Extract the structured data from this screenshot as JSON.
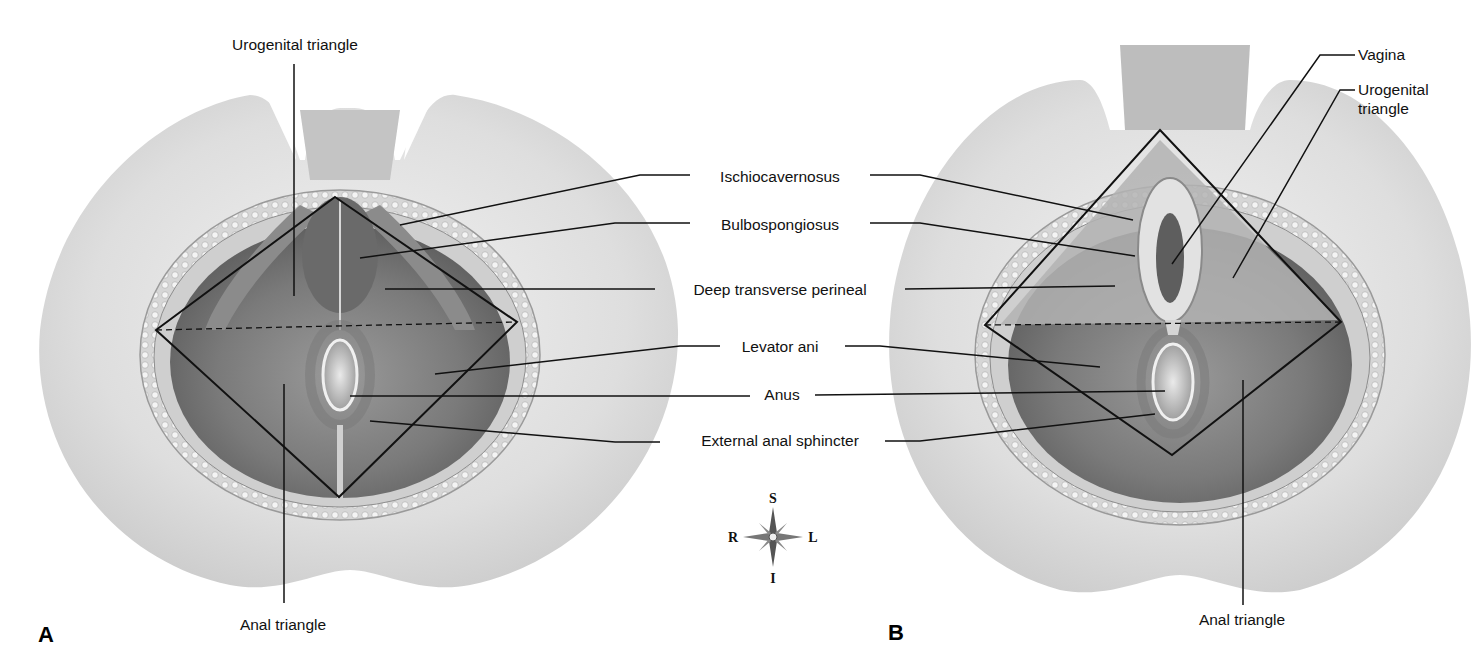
{
  "figure": {
    "panels": [
      {
        "id": "A",
        "letter": "A",
        "subject": "Male perineum"
      },
      {
        "id": "B",
        "letter": "B",
        "subject": "Female perineum"
      }
    ],
    "panel_a": {
      "top_label": "Urogenital triangle",
      "bottom_label": "Anal triangle"
    },
    "panel_b": {
      "vagina_label": "Vagina",
      "urogenital_label_line1": "Urogenital",
      "urogenital_label_line2": "triangle",
      "bottom_label": "Anal triangle"
    },
    "center_labels": [
      "Ischiocavernosus",
      "Bulbospongiosus",
      "Deep transverse perineal",
      "Levator ani",
      "Anus",
      "External anal sphincter"
    ],
    "compass": {
      "superior": "S",
      "inferior": "I",
      "right": "R",
      "left": "L"
    },
    "colors": {
      "line": "#111111",
      "skin_light": "#e6e6e6",
      "skin_mid": "#cfcfcf",
      "muscle_dark": "#6d6d6d",
      "fat": "#d9d9d9"
    }
  }
}
